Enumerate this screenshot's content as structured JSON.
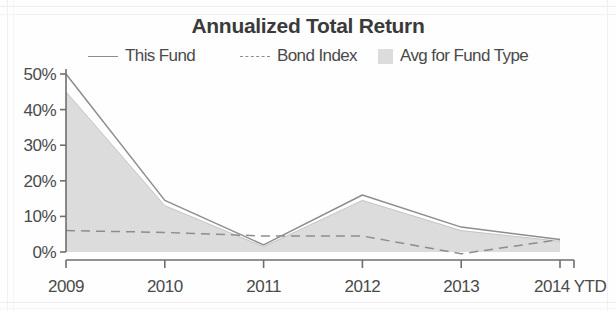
{
  "chart_data": {
    "type": "area",
    "title": "Annualized Total Return",
    "xlabel": "",
    "ylabel": "",
    "grid": false,
    "legend_position": "top",
    "categories": [
      "2009",
      "2010",
      "2011",
      "2012",
      "2013",
      "2014 YTD"
    ],
    "ylim": [
      0,
      50
    ],
    "yticks": [
      0,
      10,
      20,
      30,
      40,
      50
    ],
    "ytick_labels": [
      "0%",
      "10%",
      "20%",
      "30%",
      "40%",
      "50%"
    ],
    "series": [
      {
        "name": "This Fund",
        "style": "solid-line",
        "color": "#8d8d8d",
        "values": [
          50,
          14.5,
          2,
          16,
          7,
          3.5
        ]
      },
      {
        "name": "Bond Index",
        "style": "dashed-line",
        "color": "#8d8d8d",
        "values": [
          6,
          5.5,
          4.5,
          4.5,
          -0.5,
          3.5
        ]
      },
      {
        "name": "Avg for Fund Type",
        "style": "filled-area",
        "color": "#dcdcdc",
        "values": [
          45,
          13,
          1.5,
          14.5,
          6,
          3
        ]
      }
    ]
  },
  "legend": {
    "items": [
      {
        "label": "This Fund",
        "swatch": "line-solid-icon"
      },
      {
        "label": "Bond Index",
        "swatch": "line-dashed-icon"
      },
      {
        "label": "Avg for Fund Type",
        "swatch": "area-square-icon"
      }
    ]
  },
  "colors": {
    "line": "#8d8d8d",
    "area_fill": "#dcdcdc",
    "axis": "#6e6e6e",
    "text": "#4a4a4a",
    "title": "#3a3a3a",
    "background": "#fefefe"
  }
}
